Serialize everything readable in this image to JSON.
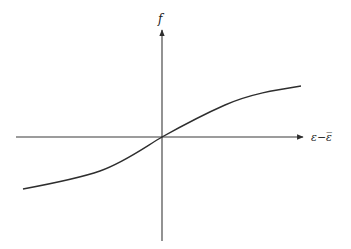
{
  "diagram": {
    "y_axis_label": "f",
    "x_axis_label": "ε−ε̅",
    "curve_description": "S-shaped curve passing through origin, concave down for positive x, concave up for negative x"
  },
  "colors": {
    "background": "#ffffff",
    "lines": "#2e2e2e"
  }
}
